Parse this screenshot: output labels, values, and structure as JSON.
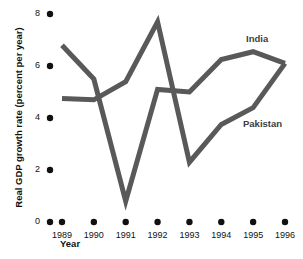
{
  "chart_data": {
    "type": "line",
    "title": "",
    "xlabel": "Year",
    "ylabel": "Real GDP growth rate (percent per year)",
    "x": [
      1989,
      1990,
      1991,
      1992,
      1993,
      1994,
      1995,
      1996
    ],
    "categories": [
      "1989",
      "1990",
      "1991",
      "1992",
      "1993",
      "1994",
      "1995",
      "1996"
    ],
    "xtick_labels": [
      "1989",
      "1990",
      "1991",
      "1992",
      "1993",
      "1994",
      "1995",
      "1996"
    ],
    "ytick_labels": [
      "0",
      "2",
      "4",
      "6",
      "8"
    ],
    "ytick_values": [
      0,
      2,
      4,
      6,
      8
    ],
    "ylim": [
      0,
      8
    ],
    "xlim": [
      1989,
      1996
    ],
    "grid": false,
    "legend_position": "inline-annotation",
    "series": [
      {
        "name": "India",
        "color": "#595959",
        "values": [
          6.8,
          5.5,
          0.8,
          5.1,
          5.0,
          6.25,
          6.55,
          6.1
        ]
      },
      {
        "name": "Pakistan",
        "color": "#595959",
        "values": [
          4.75,
          4.7,
          5.4,
          7.7,
          2.3,
          3.75,
          4.4,
          6.1
        ]
      }
    ],
    "annotations": [
      {
        "text": "India",
        "series": "India",
        "x_px": 246,
        "y_px": 33
      },
      {
        "text": "Pakistan",
        "series": "Pakistan",
        "x_px": 243,
        "y_px": 118
      }
    ],
    "style": {
      "line_color": "#595959",
      "line_width_px": 5,
      "tick_marker": "dot",
      "tick_marker_color": "#111111",
      "background": "#ffffff"
    }
  }
}
